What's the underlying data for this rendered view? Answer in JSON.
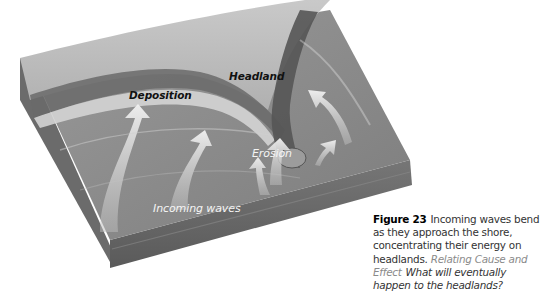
{
  "figure": {
    "number": "Figure 23",
    "labels": {
      "headland": "Headland",
      "deposition": "Deposition",
      "erosion": "Erosion",
      "incoming_waves": "Incoming waves"
    },
    "colors": {
      "land": "#b8b8b8",
      "cliff": "#5f5f5f",
      "water": "#8a8a8a",
      "front_face": "#6e6e6e",
      "side_face": "#7a7a7a",
      "arrow": "#e6e6e6"
    }
  },
  "caption": {
    "figure_number": "Figure 23",
    "text": "Incoming waves bend as they approach the shore, concentrating their energy on headlands.",
    "skill": "Relating Cause and Effect",
    "question": "What will eventually happen to the headlands?"
  }
}
